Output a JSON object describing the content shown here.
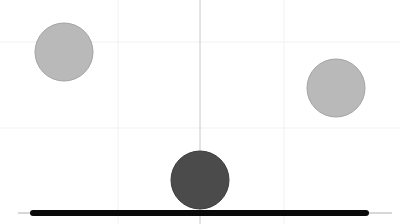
{
  "scene": {
    "width": 400,
    "height": 224,
    "background": "#ffffff",
    "grid": {
      "color": "#f1f1f1",
      "vertical_x": [
        118,
        284
      ],
      "horizontal_y": [
        42,
        128
      ]
    },
    "center_line": {
      "x": 200,
      "y1": 0,
      "y2": 224,
      "color": "#c8c8c8"
    },
    "ground_axis": {
      "x1": 18,
      "x2": 392,
      "y": 213,
      "color": "#b0b0b0"
    },
    "platform": {
      "x1": 33,
      "x2": 366,
      "y": 213,
      "thickness": 6,
      "color": "#0a0a0a"
    },
    "balls": [
      {
        "id": "left-ball",
        "cx": 64,
        "cy": 52,
        "r": 29,
        "fill": "#b9b9b9",
        "stroke": "#a3a3a3"
      },
      {
        "id": "right-ball",
        "cx": 336,
        "cy": 88,
        "r": 29,
        "fill": "#b9b9b9",
        "stroke": "#a3a3a3"
      },
      {
        "id": "player-ball",
        "cx": 200,
        "cy": 180,
        "r": 29,
        "fill": "#4b4b4b",
        "stroke": "#3a3a3a"
      }
    ]
  }
}
